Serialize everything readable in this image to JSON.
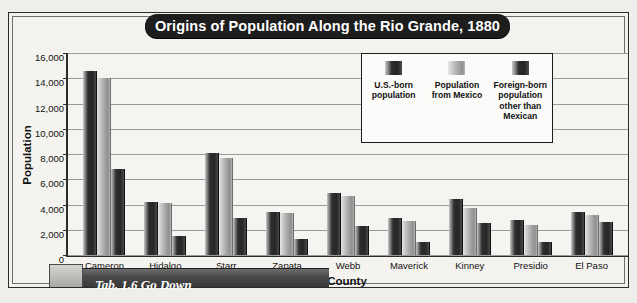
{
  "figure": {
    "title": "Origins of Population Along the Rio Grande, 1880",
    "caption_partial": "Tab. 1.6 Go Down"
  },
  "axes": {
    "y_title": "Population",
    "x_title": "County",
    "y_ticks": [
      "0",
      "2,000",
      "4,000",
      "6,000",
      "8,000",
      "10,000",
      "12,000",
      "14,000",
      "16,000"
    ]
  },
  "legend": {
    "items": [
      {
        "label": "U.S.-born population",
        "swatch": "dark-bar-swatch"
      },
      {
        "label": "Population from Mexico",
        "swatch": "light-bar-swatch"
      },
      {
        "label": "Foreign-born population other than Mexican",
        "swatch": "dark-bar-swatch"
      }
    ]
  },
  "chart_data": {
    "type": "bar",
    "title": "Origins of Population Along the Rio Grande, 1880",
    "xlabel": "County",
    "ylabel": "Population",
    "ylim": [
      0,
      16000
    ],
    "ytick_step": 2000,
    "grid": true,
    "legend_position": "inside-top-right",
    "categories": [
      "Cameron",
      "Hidalgo",
      "Starr",
      "Zapata",
      "Webb",
      "Maverick",
      "Kinney",
      "Presidio",
      "El Paso"
    ],
    "series": [
      {
        "name": "U.S.-born population",
        "values": [
          14600,
          4200,
          8100,
          3400,
          4900,
          2900,
          4400,
          2800,
          3400
        ]
      },
      {
        "name": "Population from Mexico",
        "values": [
          14000,
          4100,
          7700,
          3300,
          4700,
          2700,
          3700,
          2400,
          3200
        ]
      },
      {
        "name": "Foreign-born population other than Mexican",
        "values": [
          6800,
          1500,
          2900,
          1300,
          2300,
          1000,
          2500,
          1000,
          2600
        ]
      }
    ]
  }
}
